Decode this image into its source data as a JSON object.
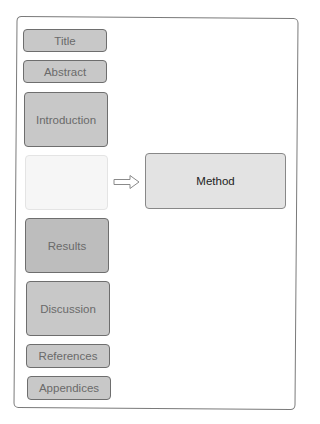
{
  "diagram": {
    "sections": [
      {
        "label": "Title"
      },
      {
        "label": "Abstract"
      },
      {
        "label": "Introduction"
      },
      {
        "label": ""
      },
      {
        "label": "Results"
      },
      {
        "label": "Discussion"
      },
      {
        "label": "References"
      },
      {
        "label": "Appendices"
      }
    ],
    "expanded": {
      "label": "Method"
    },
    "arrow": "hollow-right-arrow",
    "colors": {
      "box_fill": "#c8c8c8",
      "placeholder_fill": "#f6f6f6",
      "expanded_fill": "#e3e3e3",
      "border": "#6e6e6e",
      "text": "#6a6a6a"
    }
  }
}
